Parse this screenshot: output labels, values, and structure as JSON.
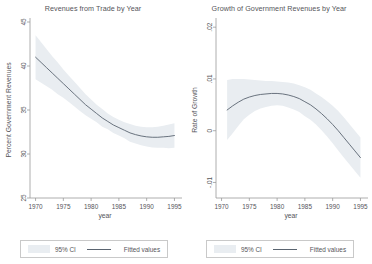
{
  "figure": {
    "width": 372,
    "height": 264,
    "background": "#ffffff",
    "ci_band_color": "#e9edf1",
    "line_color": "#5a6470",
    "axis_color": "#9a9a9a",
    "text_color": "#55555a"
  },
  "chart_data": [
    {
      "type": "line",
      "panel": "left",
      "title": "Revenues from Trade by Year",
      "xlabel": "year",
      "ylabel": "Percent Government Revenues",
      "xlim": [
        1969,
        1996
      ],
      "ylim": [
        25,
        45
      ],
      "xticks": [
        1970,
        1975,
        1980,
        1985,
        1990,
        1995
      ],
      "xticklabels": [
        "1970",
        "1975",
        "1980",
        "1985",
        "1990",
        "1995"
      ],
      "yticks": [
        25,
        30,
        35,
        40,
        45
      ],
      "yticklabels": [
        "25",
        "30",
        "35",
        "40",
        "45"
      ],
      "grid": false,
      "legend_position": "below",
      "legend": [
        "95% CI",
        "Fitted values"
      ],
      "x": [
        1970,
        1971,
        1972,
        1973,
        1974,
        1975,
        1976,
        1977,
        1978,
        1979,
        1980,
        1981,
        1982,
        1983,
        1984,
        1985,
        1986,
        1987,
        1988,
        1989,
        1990,
        1991,
        1992,
        1993,
        1994,
        1995
      ],
      "series": [
        {
          "name": "Fitted values",
          "values": [
            41.0,
            40.4,
            39.8,
            39.2,
            38.6,
            38.0,
            37.4,
            36.8,
            36.2,
            35.6,
            35.1,
            34.6,
            34.1,
            33.7,
            33.3,
            33.0,
            32.7,
            32.4,
            32.2,
            32.05,
            31.95,
            31.9,
            31.9,
            31.95,
            32.0,
            32.1
          ]
        },
        {
          "name": "95% CI upper",
          "values": [
            43.5,
            42.7,
            41.9,
            41.1,
            40.4,
            39.6,
            38.9,
            38.2,
            37.5,
            36.8,
            36.2,
            35.6,
            35.1,
            34.6,
            34.2,
            33.9,
            33.6,
            33.4,
            33.2,
            33.1,
            33.05,
            33.05,
            33.1,
            33.2,
            33.35,
            33.5
          ]
        },
        {
          "name": "95% CI lower",
          "values": [
            38.5,
            38.1,
            37.7,
            37.3,
            36.8,
            36.4,
            35.9,
            35.4,
            34.9,
            34.4,
            34.0,
            33.6,
            33.1,
            32.8,
            32.4,
            32.1,
            31.8,
            31.4,
            31.2,
            31.0,
            30.85,
            30.75,
            30.7,
            30.7,
            30.65,
            30.7
          ]
        }
      ]
    },
    {
      "type": "line",
      "panel": "right",
      "title": "Growth of Government Revenues by Year",
      "xlabel": "year",
      "ylabel": "Rate of Growth",
      "xlim": [
        1969,
        1996
      ],
      "ylim": [
        -0.013,
        0.021
      ],
      "xticks": [
        1970,
        1975,
        1980,
        1985,
        1990,
        1995
      ],
      "xticklabels": [
        "1970",
        "1975",
        "1980",
        "1985",
        "1990",
        "1995"
      ],
      "yticks": [
        -0.01,
        0,
        0.01,
        0.02
      ],
      "yticklabels": [
        "-.01",
        "0",
        ".01",
        ".02"
      ],
      "grid": false,
      "legend_position": "below",
      "legend": [
        "95% CI",
        "Fitted values"
      ],
      "x": [
        1971,
        1972,
        1973,
        1974,
        1975,
        1976,
        1977,
        1978,
        1979,
        1980,
        1981,
        1982,
        1983,
        1984,
        1985,
        1986,
        1987,
        1988,
        1989,
        1990,
        1991,
        1992,
        1993,
        1994,
        1995
      ],
      "series": [
        {
          "name": "Fitted values",
          "values": [
            0.004,
            0.0048,
            0.0055,
            0.0061,
            0.0065,
            0.0068,
            0.007,
            0.0071,
            0.0072,
            0.0072,
            0.0071,
            0.0069,
            0.0066,
            0.0062,
            0.0056,
            0.005,
            0.0042,
            0.0033,
            0.0023,
            0.0012,
            0.0,
            -0.0013,
            -0.0026,
            -0.0039,
            -0.0052
          ]
        },
        {
          "name": "95% CI upper",
          "values": [
            0.0098,
            0.01,
            0.01,
            0.01,
            0.0099,
            0.0098,
            0.0097,
            0.0096,
            0.0096,
            0.0095,
            0.0094,
            0.0093,
            0.0091,
            0.0088,
            0.0084,
            0.0079,
            0.0072,
            0.0065,
            0.0057,
            0.0048,
            0.0038,
            0.0026,
            0.0013,
            0.0,
            -0.0013
          ]
        },
        {
          "name": "95% CI lower",
          "values": [
            -0.0018,
            -0.0005,
            0.0009,
            0.0022,
            0.0031,
            0.0038,
            0.0043,
            0.0046,
            0.0048,
            0.0049,
            0.0048,
            0.0045,
            0.0041,
            0.0036,
            0.0028,
            0.0021,
            0.0012,
            0.0001,
            -0.0011,
            -0.0024,
            -0.0038,
            -0.0052,
            -0.0065,
            -0.0078,
            -0.0091
          ]
        }
      ]
    }
  ],
  "legend": {
    "ci_label": "95% CI",
    "fit_label": "Fitted values"
  }
}
